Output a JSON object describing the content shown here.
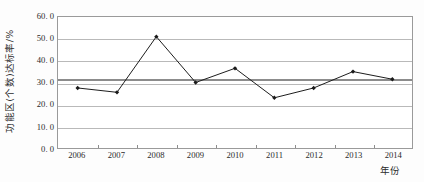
{
  "chart_data": {
    "type": "line",
    "title": "",
    "xlabel": "年份",
    "ylabel": "功能区(个数)达标率/%",
    "categories": [
      "2006",
      "2007",
      "2008",
      "2009",
      "2010",
      "2011",
      "2012",
      "2013",
      "2014"
    ],
    "values": [
      27.5,
      25.5,
      51.0,
      30.0,
      36.5,
      23.0,
      27.5,
      35.0,
      31.5
    ],
    "series": [
      {
        "name": "功能区(个数)达标率",
        "values": [
          27.5,
          25.5,
          51.0,
          30.0,
          36.5,
          23.0,
          27.5,
          35.0,
          31.5
        ],
        "color": "#1a1a1a",
        "marker": "diamond"
      }
    ],
    "reference_line": {
      "label": "",
      "value": 31.5,
      "color": "#8c8c8c"
    },
    "ylim": [
      0.0,
      60.0
    ],
    "ytick_values": [
      0.0,
      10.0,
      20.0,
      30.0,
      40.0,
      50.0,
      60.0
    ],
    "ytick_labels": [
      "0. 0",
      "10. 0",
      "20. 0",
      "30. 0",
      "40. 0",
      "50. 0",
      "60. 0"
    ],
    "grid": true,
    "grid_axis": "y",
    "legend": false,
    "legend_position": "none",
    "annotations": []
  }
}
